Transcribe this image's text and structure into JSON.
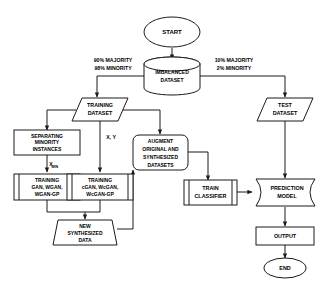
{
  "diagram": {
    "type": "flowchart",
    "colors": {
      "stroke": "#1a1a1a",
      "fill": "#ffffff",
      "background": "#ffffff",
      "text": "#000000"
    },
    "nodes": [
      {
        "id": "start",
        "shape": "ellipse",
        "label": "START",
        "lines": [
          "START"
        ]
      },
      {
        "id": "imbalanced_dataset",
        "shape": "cylinder",
        "label": "IMBALANCED DATASET",
        "lines": [
          "IMBALANCED",
          "DATASET"
        ]
      },
      {
        "id": "training_dataset",
        "shape": "parallelogram",
        "label": "TRAINING DATASET",
        "lines": [
          "TRAINING",
          "DATASET"
        ]
      },
      {
        "id": "test_dataset",
        "shape": "parallelogram",
        "label": "TEST DATASET",
        "lines": [
          "TEST",
          "DATASET"
        ]
      },
      {
        "id": "separating_minority",
        "shape": "rectangle",
        "label": "SEPARATING MINORITY INSTANCES",
        "lines": [
          "SEPARATING",
          "MINORITY",
          "INSTANCES"
        ]
      },
      {
        "id": "training_gan",
        "shape": "predefined-process",
        "label": "TRAINING GAN, WGAN, WGAN-GP",
        "lines": [
          "TRAINING",
          "GAN, WGAN,",
          "WGAN-GP"
        ]
      },
      {
        "id": "training_cgan",
        "shape": "predefined-process",
        "label": "TRAINING cGAN, WcGAN, WcGAN-GP",
        "lines": [
          "TRAINING",
          "cGAN, WcGAN,",
          "WcGAN-GP"
        ]
      },
      {
        "id": "new_synthesized_data",
        "shape": "trapezoid",
        "label": "NEW SYNTHESIZED DATA",
        "lines": [
          "NEW",
          "SYNTHESIZED",
          "DATA"
        ]
      },
      {
        "id": "augment_datasets",
        "shape": "rounded-rectangle",
        "label": "AUGMENT ORIGINAL AND SYNTHESIZED DATASETS",
        "lines": [
          "AUGMENT",
          "ORIGINAL AND",
          "SYNTHESIZED",
          "DATASETS"
        ]
      },
      {
        "id": "train_classifier",
        "shape": "predefined-process",
        "label": "TRAIN CLASSIFIER",
        "lines": [
          "TRAIN",
          "CLASSIFIER"
        ]
      },
      {
        "id": "prediction_model",
        "shape": "stored-data",
        "label": "PREDICTION MODEL",
        "lines": [
          "PREDICTION",
          "MODEL"
        ]
      },
      {
        "id": "output",
        "shape": "rectangle",
        "label": "OUTPUT",
        "lines": [
          "OUTPUT"
        ]
      },
      {
        "id": "end",
        "shape": "ellipse",
        "label": "END",
        "lines": [
          "END"
        ]
      }
    ],
    "edge_labels": [
      {
        "id": "split_left",
        "lines": [
          "90% MAJORITY",
          "98% MINORITY"
        ],
        "from": "imbalanced_dataset",
        "to": "training_dataset"
      },
      {
        "id": "split_right",
        "lines": [
          "10% MAJORITY",
          "2% MINORITY"
        ],
        "from": "imbalanced_dataset",
        "to": "test_dataset"
      },
      {
        "id": "xy",
        "base": "X, Y",
        "sub": "",
        "from": "training_dataset",
        "to": "training_cgan"
      },
      {
        "id": "xmin",
        "base": "X",
        "sub": "MIN",
        "from": "separating_minority",
        "to": "training_gan"
      }
    ]
  }
}
